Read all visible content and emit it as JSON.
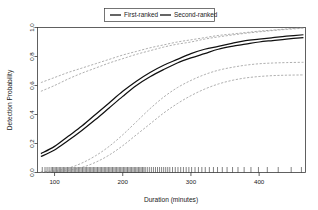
{
  "chart_data": {
    "type": "line",
    "title": "",
    "xlabel": "Duration (minutes)",
    "ylabel": "Detection Probability",
    "xlim": [
      75,
      468
    ],
    "ylim": [
      0.0,
      1.0
    ],
    "grid": false,
    "legend_position": "top-center",
    "xticks": [
      100,
      200,
      300,
      400
    ],
    "xtick_labels": [
      "100",
      "200",
      "300",
      "400"
    ],
    "yticks": [
      0.0,
      0.2,
      0.4,
      0.6,
      0.8,
      1.0
    ],
    "ytick_labels": [
      "0.0",
      "0.2",
      "0.4",
      "0.6",
      "0.8",
      "1.0"
    ],
    "legend": [
      {
        "name": "First-ranked",
        "style": "solid",
        "color": "#111111"
      },
      {
        "name": "Second-ranked",
        "style": "solid",
        "color": "#111111"
      }
    ],
    "x": [
      80,
      100,
      120,
      140,
      160,
      180,
      200,
      220,
      240,
      260,
      280,
      300,
      320,
      340,
      360,
      380,
      400,
      420,
      440,
      465
    ],
    "series": [
      {
        "name": "First-ranked",
        "style": "solid",
        "values": [
          0.13,
          0.18,
          0.25,
          0.32,
          0.4,
          0.48,
          0.56,
          0.63,
          0.69,
          0.74,
          0.78,
          0.82,
          0.85,
          0.87,
          0.89,
          0.91,
          0.92,
          0.93,
          0.94,
          0.95
        ]
      },
      {
        "name": "Second-ranked",
        "style": "solid",
        "values": [
          0.11,
          0.155,
          0.22,
          0.29,
          0.365,
          0.445,
          0.525,
          0.6,
          0.66,
          0.71,
          0.755,
          0.79,
          0.82,
          0.85,
          0.87,
          0.885,
          0.9,
          0.91,
          0.92,
          0.93
        ]
      },
      {
        "name": "First-ranked upper band",
        "style": "dashed",
        "values": [
          0.62,
          0.655,
          0.69,
          0.72,
          0.75,
          0.78,
          0.81,
          0.835,
          0.86,
          0.88,
          0.9,
          0.915,
          0.93,
          0.945,
          0.955,
          0.965,
          0.975,
          0.982,
          0.99,
          0.998
        ]
      },
      {
        "name": "Second-ranked upper band",
        "style": "dashed",
        "values": [
          0.56,
          0.6,
          0.645,
          0.685,
          0.72,
          0.755,
          0.785,
          0.815,
          0.84,
          0.865,
          0.885,
          0.9,
          0.92,
          0.935,
          0.948,
          0.96,
          0.97,
          0.979,
          0.987,
          0.995
        ]
      },
      {
        "name": "First-ranked lower band",
        "style": "dashed",
        "values": [
          0.005,
          0.012,
          0.03,
          0.065,
          0.115,
          0.18,
          0.26,
          0.35,
          0.44,
          0.52,
          0.585,
          0.635,
          0.675,
          0.705,
          0.725,
          0.74,
          0.75,
          0.755,
          0.758,
          0.76
        ]
      },
      {
        "name": "Second-ranked lower band",
        "style": "dashed",
        "values": [
          0.002,
          0.006,
          0.015,
          0.035,
          0.07,
          0.12,
          0.185,
          0.26,
          0.335,
          0.41,
          0.475,
          0.53,
          0.575,
          0.61,
          0.635,
          0.652,
          0.662,
          0.668,
          0.671,
          0.673
        ]
      }
    ],
    "rug_values": [
      82,
      86,
      89,
      92,
      95,
      97,
      99,
      101,
      103,
      105,
      107,
      109,
      111,
      113,
      115,
      117,
      119,
      121,
      123,
      125,
      127,
      129,
      131,
      133,
      135,
      137,
      139,
      141,
      143,
      145,
      147,
      149,
      151,
      153,
      155,
      157,
      159,
      161,
      163,
      165,
      167,
      169,
      171,
      173,
      175,
      177,
      179,
      181,
      183,
      185,
      187,
      189,
      191,
      193,
      195,
      197,
      199,
      201,
      203,
      205,
      207,
      209,
      211,
      213,
      215,
      217,
      219,
      221,
      223,
      225,
      227,
      229,
      231,
      233,
      236,
      239,
      242,
      245,
      248,
      251,
      254,
      257,
      260,
      263,
      266,
      269,
      273,
      277,
      281,
      285,
      289,
      293,
      297,
      301,
      306,
      311,
      316,
      321,
      327,
      333,
      339,
      346,
      353,
      361,
      369,
      378,
      388,
      399,
      412,
      428,
      447,
      462
    ]
  }
}
